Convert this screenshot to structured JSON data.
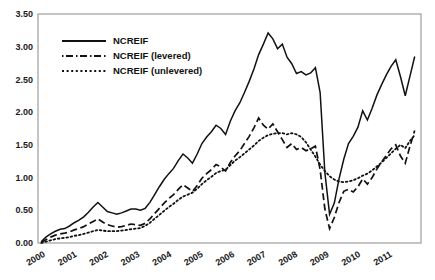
{
  "chart_data": {
    "type": "line",
    "title": "",
    "xlabel": "",
    "ylabel": "",
    "xlim": [
      1999.75,
      2011.9
    ],
    "ylim": [
      0.0,
      3.5
    ],
    "grid": false,
    "legend_position": "top-left",
    "ytick_labels": [
      "0.00",
      "0.50",
      "1.00",
      "1.50",
      "2.00",
      "2.50",
      "3.00",
      "3.50"
    ],
    "ytick_values": [
      0.0,
      0.5,
      1.0,
      1.5,
      2.0,
      2.5,
      3.0,
      3.5
    ],
    "xtick_labels": [
      "2000",
      "2001",
      "2002",
      "2003",
      "2004",
      "2005",
      "2006",
      "2007",
      "2008",
      "2009",
      "2010",
      "2011"
    ],
    "xtick_values": [
      2000,
      2001,
      2002,
      2003,
      2004,
      2005,
      2006,
      2007,
      2008,
      2009,
      2010,
      2011
    ],
    "x": [
      1999.85,
      2000.0,
      2000.15,
      2000.3,
      2000.45,
      2000.6,
      2000.75,
      2000.9,
      2001.05,
      2001.2,
      2001.35,
      2001.5,
      2001.65,
      2001.8,
      2001.95,
      2002.1,
      2002.25,
      2002.4,
      2002.55,
      2002.7,
      2002.85,
      2003.0,
      2003.15,
      2003.3,
      2003.45,
      2003.6,
      2003.75,
      2003.9,
      2004.05,
      2004.2,
      2004.35,
      2004.5,
      2004.65,
      2004.8,
      2004.95,
      2005.1,
      2005.25,
      2005.4,
      2005.55,
      2005.7,
      2005.85,
      2006.0,
      2006.15,
      2006.3,
      2006.45,
      2006.6,
      2006.75,
      2006.9,
      2007.05,
      2007.2,
      2007.35,
      2007.5,
      2007.65,
      2007.8,
      2007.95,
      2008.1,
      2008.25,
      2008.4,
      2008.55,
      2008.7,
      2008.85,
      2009.0,
      2009.15,
      2009.3,
      2009.45,
      2009.6,
      2009.75,
      2009.9,
      2010.05,
      2010.2,
      2010.35,
      2010.5,
      2010.65,
      2010.8,
      2010.95,
      2011.1,
      2011.25,
      2011.4,
      2011.55,
      2011.7
    ],
    "series": [
      {
        "name": "NCREIF",
        "style": "solid",
        "values": [
          0.02,
          0.09,
          0.14,
          0.18,
          0.21,
          0.22,
          0.26,
          0.31,
          0.35,
          0.4,
          0.47,
          0.55,
          0.62,
          0.55,
          0.48,
          0.46,
          0.44,
          0.46,
          0.49,
          0.52,
          0.52,
          0.5,
          0.53,
          0.62,
          0.74,
          0.86,
          0.97,
          1.06,
          1.14,
          1.26,
          1.36,
          1.3,
          1.22,
          1.36,
          1.52,
          1.62,
          1.7,
          1.8,
          1.75,
          1.66,
          1.86,
          2.02,
          2.14,
          2.3,
          2.47,
          2.66,
          2.88,
          3.04,
          3.21,
          3.12,
          2.97,
          3.04,
          2.84,
          2.74,
          2.59,
          2.62,
          2.57,
          2.6,
          2.68,
          2.3,
          1.08,
          0.44,
          0.61,
          0.98,
          1.28,
          1.52,
          1.63,
          1.77,
          2.02,
          1.88,
          2.06,
          2.26,
          2.42,
          2.57,
          2.7,
          2.8,
          2.54,
          2.25,
          2.55,
          2.85
        ]
      },
      {
        "name": "NCREIF (levered)",
        "style": "dashed",
        "values": [
          0.01,
          0.05,
          0.09,
          0.12,
          0.14,
          0.15,
          0.17,
          0.2,
          0.22,
          0.25,
          0.29,
          0.33,
          0.37,
          0.32,
          0.28,
          0.26,
          0.24,
          0.25,
          0.27,
          0.29,
          0.28,
          0.27,
          0.3,
          0.37,
          0.45,
          0.53,
          0.61,
          0.68,
          0.74,
          0.82,
          0.89,
          0.84,
          0.79,
          0.88,
          0.99,
          1.06,
          1.12,
          1.2,
          1.16,
          1.1,
          1.23,
          1.33,
          1.41,
          1.52,
          1.63,
          1.76,
          1.91,
          1.8,
          1.74,
          1.82,
          1.7,
          1.58,
          1.46,
          1.52,
          1.43,
          1.46,
          1.41,
          1.44,
          1.48,
          1.12,
          0.52,
          0.22,
          0.39,
          0.62,
          0.79,
          0.82,
          0.78,
          0.86,
          0.98,
          0.9,
          1.0,
          1.13,
          1.24,
          1.34,
          1.44,
          1.5,
          1.33,
          1.22,
          1.48,
          1.72
        ]
      },
      {
        "name": "NCREIF (unlevered)",
        "style": "dotted",
        "values": [
          0.0,
          0.02,
          0.04,
          0.06,
          0.07,
          0.08,
          0.09,
          0.11,
          0.12,
          0.14,
          0.16,
          0.18,
          0.2,
          0.19,
          0.18,
          0.18,
          0.18,
          0.19,
          0.2,
          0.21,
          0.22,
          0.23,
          0.26,
          0.31,
          0.37,
          0.43,
          0.49,
          0.55,
          0.6,
          0.66,
          0.71,
          0.74,
          0.77,
          0.83,
          0.9,
          0.96,
          1.01,
          1.07,
          1.1,
          1.12,
          1.19,
          1.26,
          1.31,
          1.37,
          1.43,
          1.49,
          1.56,
          1.61,
          1.65,
          1.67,
          1.68,
          1.68,
          1.66,
          1.68,
          1.66,
          1.62,
          1.54,
          1.43,
          1.32,
          1.2,
          1.1,
          1.02,
          0.97,
          0.94,
          0.93,
          0.94,
          0.96,
          0.99,
          1.03,
          1.06,
          1.11,
          1.17,
          1.23,
          1.3,
          1.37,
          1.44,
          1.5,
          1.45,
          1.56,
          1.65
        ]
      }
    ]
  },
  "legend": {
    "items": [
      {
        "label": "NCREIF",
        "style": "solid"
      },
      {
        "label": "NCREIF (levered)",
        "style": "dashed"
      },
      {
        "label": "NCREIF (unlevered)",
        "style": "dotted"
      }
    ]
  }
}
